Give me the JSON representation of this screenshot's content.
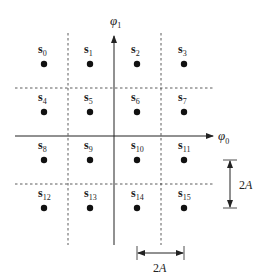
{
  "diagram": {
    "type": "16-QAM signal constellation",
    "axes": {
      "horizontal": {
        "symbol": "φ",
        "subscript": "0"
      },
      "vertical": {
        "symbol": "φ",
        "subscript": "1"
      }
    },
    "points": [
      {
        "name": "s",
        "index": "0"
      },
      {
        "name": "s",
        "index": "1"
      },
      {
        "name": "s",
        "index": "2"
      },
      {
        "name": "s",
        "index": "3"
      },
      {
        "name": "s",
        "index": "4"
      },
      {
        "name": "s",
        "index": "5"
      },
      {
        "name": "s",
        "index": "6"
      },
      {
        "name": "s",
        "index": "7"
      },
      {
        "name": "s",
        "index": "8"
      },
      {
        "name": "s",
        "index": "9"
      },
      {
        "name": "s",
        "index": "10"
      },
      {
        "name": "s",
        "index": "11"
      },
      {
        "name": "s",
        "index": "12"
      },
      {
        "name": "s",
        "index": "13"
      },
      {
        "name": "s",
        "index": "14"
      },
      {
        "name": "s",
        "index": "15"
      }
    ],
    "dimensions": {
      "vertical_spacing": {
        "value": "2",
        "unit": "A"
      },
      "horizontal_spacing": {
        "value": "2",
        "unit": "A"
      }
    },
    "colors": {
      "ink": "#222222",
      "background": "#ffffff"
    }
  }
}
